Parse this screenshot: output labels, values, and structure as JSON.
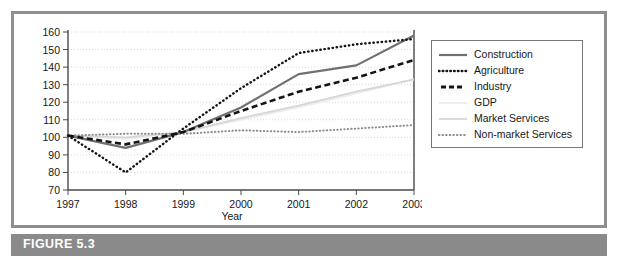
{
  "figure": {
    "caption": "FIGURE 5.3"
  },
  "chart_data": {
    "type": "line",
    "title": "",
    "xlabel": "Year",
    "ylabel": "",
    "categories": [
      "1997",
      "1998",
      "1999",
      "2000",
      "2001",
      "2002",
      "2003"
    ],
    "x": [
      1997,
      1998,
      1999,
      2000,
      2001,
      2002,
      2003
    ],
    "ylim": [
      70,
      160
    ],
    "yticks": [
      70,
      80,
      90,
      100,
      110,
      120,
      130,
      140,
      150,
      160
    ],
    "grid": true,
    "legend_position": "right",
    "series": [
      {
        "name": "Construction",
        "values": [
          101,
          94,
          103,
          117,
          136,
          141,
          158
        ],
        "color": "#707070",
        "style": "solid",
        "width": 2.2
      },
      {
        "name": "Agriculture",
        "values": [
          101,
          80,
          105,
          128,
          148,
          153,
          156
        ],
        "color": "#141414",
        "style": "dotted",
        "width": 2.4
      },
      {
        "name": "Industry",
        "values": [
          101,
          96,
          103,
          115,
          126,
          134,
          144
        ],
        "color": "#141414",
        "style": "dashed",
        "width": 2.6
      },
      {
        "name": "GDP",
        "values": [
          101,
          99,
          103,
          110,
          117,
          125,
          133
        ],
        "color": "#ededed",
        "style": "solid",
        "width": 1.8
      },
      {
        "name": "Market Services",
        "values": [
          101,
          100,
          103,
          111,
          118,
          126,
          133
        ],
        "color": "#d6d6d6",
        "style": "solid",
        "width": 1.8
      },
      {
        "name": "Non-market Services",
        "values": [
          101,
          102,
          102,
          104,
          103,
          105,
          107
        ],
        "color": "#8c8c8c",
        "style": "dotted",
        "width": 2.0
      }
    ]
  },
  "legend": {
    "items": [
      {
        "label": "Construction"
      },
      {
        "label": "Agriculture"
      },
      {
        "label": "Industry"
      },
      {
        "label": "GDP"
      },
      {
        "label": "Market Services"
      },
      {
        "label": "Non-market Services"
      }
    ]
  },
  "colors": {
    "frame": "#8e8e8e",
    "caption_band": "#8a8a8a",
    "caption_text": "#ffffff",
    "axis": "#4a4a4a",
    "gridline": "#d9d9d9",
    "text": "#171717"
  }
}
